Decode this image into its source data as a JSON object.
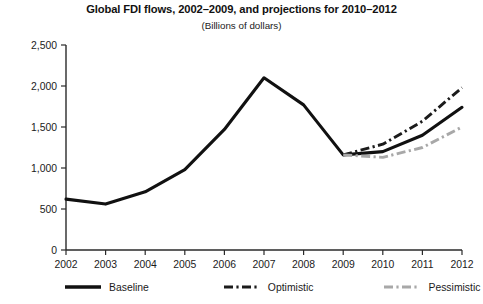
{
  "chart_data": {
    "type": "line",
    "title": "Global FDI flows, 2002–2009, and projections for 2010–2012",
    "subtitle": "(Billions of dollars)",
    "xlabel": "",
    "ylabel": "",
    "categories": [
      "2002",
      "2003",
      "2004",
      "2005",
      "2006",
      "2007",
      "2008",
      "2009",
      "2010",
      "2011",
      "2012"
    ],
    "x": [
      2002,
      2003,
      2004,
      2005,
      2006,
      2007,
      2008,
      2009,
      2010,
      2011,
      2012
    ],
    "ylim": [
      0,
      2500
    ],
    "yticks": [
      0,
      500,
      1000,
      1500,
      2000,
      2500
    ],
    "ytick_labels": [
      "0",
      "500",
      "1,000",
      "1,500",
      "2,000",
      "2,500"
    ],
    "grid": false,
    "legend_position": "bottom",
    "series": [
      {
        "name": "Baseline",
        "style": "solid",
        "color": "#111111",
        "x": [
          2002,
          2003,
          2004,
          2005,
          2006,
          2007,
          2008,
          2009,
          2010,
          2011,
          2012
        ],
        "values": [
          620,
          560,
          710,
          980,
          1470,
          2100,
          1770,
          1160,
          1200,
          1400,
          1740
        ]
      },
      {
        "name": "Optimistic",
        "style": "dash-dot",
        "color": "#1b1b1b",
        "x": [
          2009,
          2010,
          2011,
          2012
        ],
        "values": [
          1160,
          1290,
          1570,
          1980
        ]
      },
      {
        "name": "Pessimistic",
        "style": "dash-dot",
        "color": "#a8a8a8",
        "x": [
          2009,
          2010,
          2011,
          2012
        ],
        "values": [
          1160,
          1130,
          1250,
          1500
        ]
      }
    ]
  },
  "legend": {
    "items": [
      {
        "label": "Baseline"
      },
      {
        "label": "Optimistic"
      },
      {
        "label": "Pessimistic"
      }
    ]
  }
}
